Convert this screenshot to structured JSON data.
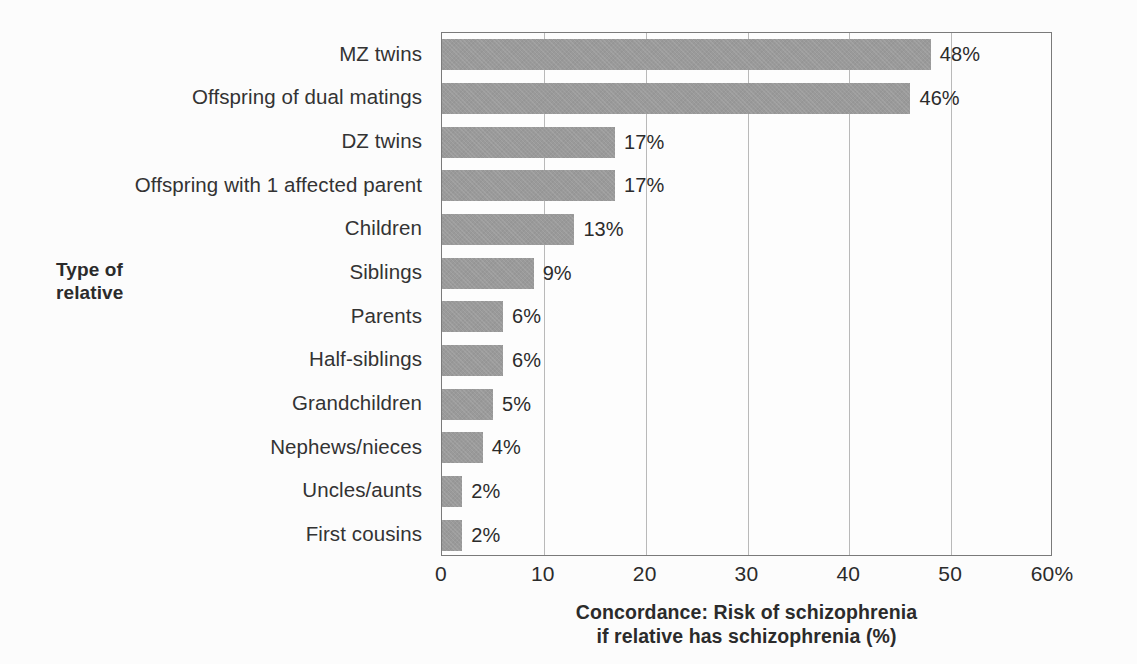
{
  "chart_data": {
    "type": "bar",
    "orientation": "horizontal",
    "title": "",
    "xlabel_line1": "Concordance: Risk of schizophrenia",
    "xlabel_line2": "if relative has schizophrenia (%)",
    "ylabel_line1": "Type of",
    "ylabel_line2": "relative",
    "xlim": [
      0,
      60
    ],
    "xticks": [
      0,
      10,
      20,
      30,
      40,
      50,
      60
    ],
    "xtick_labels": [
      "0",
      "10",
      "20",
      "30",
      "40",
      "50",
      "60%"
    ],
    "grid": "vertical",
    "legend": "none",
    "bar_color": "#9a9a9a",
    "axis_color": "#7a7a7a",
    "gridline_color": "#b9b9b9",
    "background_color": "#fcfcfc",
    "categories": [
      "MZ twins",
      "Offspring of dual matings",
      "DZ twins",
      "Offspring with 1 affected parent",
      "Children",
      "Siblings",
      "Parents",
      "Half-siblings",
      "Grandchildren",
      "Nephews/nieces",
      "Uncles/aunts",
      "First cousins"
    ],
    "values": [
      48,
      46,
      17,
      17,
      13,
      9,
      6,
      6,
      5,
      4,
      2,
      2
    ],
    "value_labels": [
      "48%",
      "46%",
      "17%",
      "17%",
      "13%",
      "9%",
      "6%",
      "6%",
      "5%",
      "4%",
      "2%",
      "2%"
    ]
  }
}
